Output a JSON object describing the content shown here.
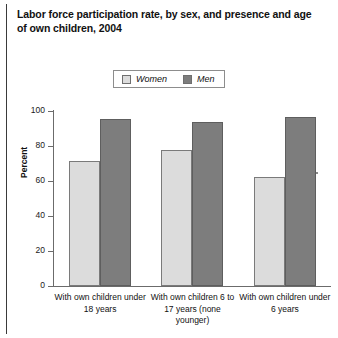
{
  "title": "Labor force participation rate, by sex, and presence and age of own children, 2004",
  "legend": {
    "items": [
      {
        "label": "Women",
        "color": "#dcdcdc"
      },
      {
        "label": "Men",
        "color": "#7d7d7d"
      }
    ]
  },
  "axis": {
    "ylabel": "Percent",
    "yticks": [
      "0",
      "20",
      "40",
      "60",
      "80",
      "100"
    ]
  },
  "chart_data": {
    "type": "bar",
    "title": "Labor force participation rate, by sex, and presence and age of own children, 2004",
    "xlabel": "",
    "ylabel": "Percent",
    "ylim": [
      0,
      100
    ],
    "yticks": [
      0,
      20,
      40,
      60,
      80,
      100
    ],
    "grid": false,
    "legend_position": "top-center",
    "categories": [
      "With own children under 18 years",
      "With own children 6 to 17 years (none younger)",
      "With own children under 6 years"
    ],
    "series": [
      {
        "name": "Women",
        "color": "#dcdcdc",
        "values": [
          71,
          77,
          62
        ]
      },
      {
        "name": "Men",
        "color": "#7d7d7d",
        "values": [
          95,
          93,
          96
        ]
      }
    ]
  }
}
